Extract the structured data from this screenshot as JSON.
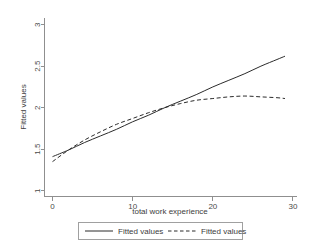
{
  "chart_data": {
    "type": "line",
    "title": "",
    "subtitle": "",
    "xlabel": "total work experience",
    "ylabel": "Fitted values",
    "xlim": [
      -1,
      30.5
    ],
    "ylim": [
      0.93,
      3.08
    ],
    "xticks": [
      0,
      10,
      20,
      30
    ],
    "xticklabels": [
      "0",
      "10",
      "20",
      "30"
    ],
    "yticks": [
      1,
      1.5,
      2,
      2.5,
      3
    ],
    "yticklabels": [
      "1",
      "1.5",
      "2",
      "2.5",
      "3"
    ],
    "grid": false,
    "legend_position": "below-axes",
    "series": [
      {
        "name": "Fitted values",
        "style": "solid",
        "color": "#2b2b2b",
        "x": [
          0,
          2,
          4,
          6,
          8,
          10,
          12,
          14,
          16,
          18,
          20,
          22,
          24,
          26,
          28,
          29
        ],
        "values": [
          1.41,
          1.49,
          1.58,
          1.66,
          1.74,
          1.83,
          1.91,
          2.0,
          2.08,
          2.16,
          2.25,
          2.33,
          2.41,
          2.5,
          2.58,
          2.62
        ]
      },
      {
        "name": "Fitted values",
        "style": "dashed",
        "color": "#2b2b2b",
        "x": [
          0,
          2,
          4,
          6,
          8,
          10,
          12,
          14,
          16,
          18,
          20,
          22,
          24,
          26,
          28,
          29
        ],
        "values": [
          1.35,
          1.49,
          1.61,
          1.71,
          1.8,
          1.87,
          1.94,
          2.0,
          2.05,
          2.09,
          2.11,
          2.13,
          2.14,
          2.13,
          2.12,
          2.11
        ]
      }
    ],
    "annotations": []
  },
  "legend": {
    "entries": [
      {
        "label": "Fitted values",
        "style": "solid"
      },
      {
        "label": "Fitted values",
        "style": "dashed"
      }
    ]
  },
  "colors": {
    "background": "#ffffff",
    "axis": "#8f8f8f",
    "line": "#2b2b2b",
    "text": "#3c3c3c"
  }
}
